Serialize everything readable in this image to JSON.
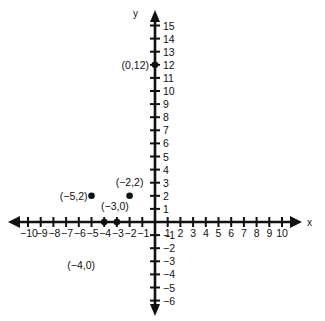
{
  "chart_data": {
    "type": "scatter",
    "title": "",
    "xlabel": "x",
    "ylabel": "y",
    "xlim": [
      -10,
      10
    ],
    "ylim": [
      -6,
      15
    ],
    "grid": false,
    "x_ticks": [
      -10,
      -9,
      -8,
      -7,
      -6,
      -5,
      -4,
      -3,
      -2,
      -1,
      1,
      2,
      3,
      4,
      5,
      6,
      7,
      8,
      9,
      10
    ],
    "y_ticks": [
      -6,
      -5,
      -4,
      -3,
      -2,
      -1,
      1,
      2,
      3,
      4,
      5,
      6,
      7,
      8,
      9,
      10,
      11,
      12,
      13,
      14,
      15
    ],
    "x_tick_labels": [
      "−10",
      "−9",
      "−8",
      "−7",
      "−6",
      "−5",
      "−4",
      "−3",
      "−2",
      "−1",
      "1",
      "2",
      "3",
      "4",
      "5",
      "6",
      "7",
      "8",
      "9",
      "10"
    ],
    "y_tick_labels": [
      "−6",
      "−5",
      "−4",
      "−3",
      "−2",
      "−1",
      "1",
      "2",
      "3",
      "4",
      "5",
      "6",
      "7",
      "8",
      "9",
      "10",
      "11",
      "12",
      "13",
      "14",
      "15"
    ],
    "points": [
      {
        "x": 0,
        "y": 12,
        "label": "(0,12)"
      },
      {
        "x": -5,
        "y": 2,
        "label": "(−5,2)"
      },
      {
        "x": -2,
        "y": 2,
        "label": "(−2,2)"
      },
      {
        "x": -3,
        "y": 0,
        "label": "(−3,0)"
      },
      {
        "x": -4,
        "y": 0,
        "label": "(−4,0)"
      }
    ],
    "annotations": [
      "(0,12)",
      "(−5,2)",
      "(−2,2)",
      "(−3,0)",
      "(−4,0)"
    ],
    "color": "#111111"
  }
}
